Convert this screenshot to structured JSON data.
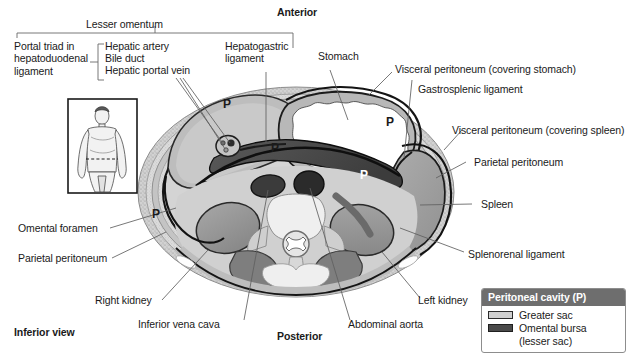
{
  "figure": {
    "title_orientations": {
      "anterior": "Anterior",
      "posterior": "Posterior",
      "inferior_view": "Inferior view"
    }
  },
  "brackets": {
    "lesser_omentum": "Lesser omentum"
  },
  "labels": {
    "portal_triad": "Portal triad in\nhepatoduodenal\nligament",
    "hepatic_artery": "Hepatic artery",
    "bile_duct": "Bile duct",
    "hepatic_portal_vein": "Hepatic portal vein",
    "hepatogastric_ligament": "Hepatogastric\nligament",
    "stomach": "Stomach",
    "visceral_peritoneum_stomach": "Visceral peritoneum (covering stomach)",
    "gastrosplenic_ligament": "Gastrosplenic ligament",
    "visceral_peritoneum_spleen": "Visceral peritoneum (covering spleen)",
    "parietal_peritoneum_right": "Parietal peritoneum",
    "spleen": "Spleen",
    "splenorenal_ligament": "Splenorenal ligament",
    "omental_foramen": "Omental foramen",
    "parietal_peritoneum_left": "Parietal peritoneum",
    "right_kidney": "Right kidney",
    "inferior_vena_cava": "Inferior vena cava",
    "abdominal_aorta": "Abdominal aorta",
    "left_kidney": "Left kidney"
  },
  "cavity_markers": {
    "marker": "P",
    "positions": [
      {
        "x": 223,
        "y": 104
      },
      {
        "x": 272,
        "y": 148
      },
      {
        "x": 388,
        "y": 122
      },
      {
        "x": 155,
        "y": 214
      },
      {
        "x": 362,
        "y": 175
      }
    ]
  },
  "legend": {
    "header": "Peritoneal cavity (P)",
    "items": [
      {
        "swatch": "greater-sac-swatch",
        "label": "Greater sac"
      },
      {
        "swatch": "omental-bursa-swatch",
        "label": "Omental bursa\n(lesser sac)"
      }
    ]
  },
  "inset": {
    "name": "body-orientation-inset"
  },
  "colors": {
    "body_wall_stipple": "#c9c9c9",
    "greater_sac": "#cfcfcf",
    "omental_bursa": "#4a4a4a",
    "organ_mid_gray": "#9a9a9a",
    "organ_dark_gray": "#6f6f6f",
    "stomach_lumen": "#ffffff",
    "legend_header": "#6e6e6e",
    "leader_line": "#555555",
    "outline": "#1a1a1a"
  }
}
